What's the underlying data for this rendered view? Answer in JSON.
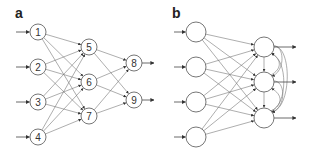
{
  "panels": [
    {
      "label": "a",
      "title": "Feedforward network",
      "nodes": [
        {
          "id": "1",
          "x": 38,
          "y": 32,
          "layer": "input"
        },
        {
          "id": "2",
          "x": 38,
          "y": 67,
          "layer": "input"
        },
        {
          "id": "3",
          "x": 38,
          "y": 102,
          "layer": "input"
        },
        {
          "id": "4",
          "x": 38,
          "y": 137,
          "layer": "input"
        },
        {
          "id": "5",
          "x": 89,
          "y": 47,
          "layer": "hidden"
        },
        {
          "id": "6",
          "x": 89,
          "y": 82,
          "layer": "hidden"
        },
        {
          "id": "7",
          "x": 89,
          "y": 116,
          "layer": "hidden"
        },
        {
          "id": "8",
          "x": 134,
          "y": 63,
          "layer": "output"
        },
        {
          "id": "9",
          "x": 134,
          "y": 100,
          "layer": "output"
        }
      ],
      "edges": "fully connected input→hidden, hidden→output"
    },
    {
      "label": "b",
      "title": "Recurrent network",
      "nodes": [
        {
          "id": "i1",
          "x": 196,
          "y": 32
        },
        {
          "id": "i2",
          "x": 196,
          "y": 67
        },
        {
          "id": "i3",
          "x": 196,
          "y": 102
        },
        {
          "id": "i4",
          "x": 196,
          "y": 137
        },
        {
          "id": "o1",
          "x": 264,
          "y": 47
        },
        {
          "id": "o2",
          "x": 264,
          "y": 82
        },
        {
          "id": "o3",
          "x": 264,
          "y": 118
        }
      ],
      "edges": "fully connected input→output with lateral/recurrent connections among output nodes"
    }
  ],
  "colors": {
    "stroke": "#666666",
    "edge": "#777777",
    "background": "#ffffff"
  }
}
